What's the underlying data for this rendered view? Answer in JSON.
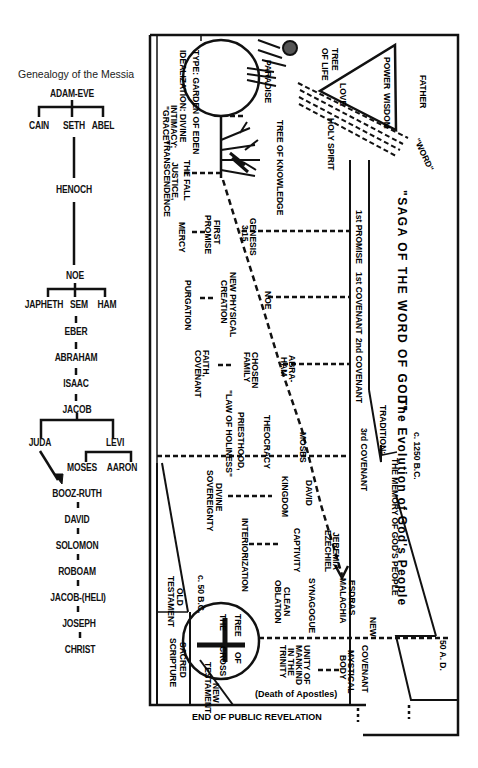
{
  "genealogy": {
    "title": "Genealogy of the Messia",
    "nodes": {
      "adam_eve": "ADAM-EVE",
      "cain": "CAIN",
      "seth": "SETH",
      "abel": "ABEL",
      "henoch": "HENOCH",
      "noe": "NOE",
      "japheth": "JAPHETH",
      "sem": "SEM",
      "ham": "HAM",
      "eber": "EBER",
      "abraham": "ABRAHAM",
      "isaac": "ISAAC",
      "jacob": "JACOB",
      "juda": "JUDA",
      "levi": "LEVI",
      "moses": "MOSES",
      "aaron": "AARON",
      "booz_ruth": "BOOZ-RUTH",
      "david": "DAVID",
      "solomon": "SOLOMON",
      "roboam": "ROBOAM",
      "jacob_heli": "JACOB-(HELI)",
      "joseph": "JOSEPH",
      "christ": "CHRIST"
    }
  },
  "saga": {
    "title": "\"SAGA OF THE WORD OF GOD\"",
    "subtitle": "The Evolution of God's People",
    "date_start": "c. 1250 B.C.",
    "date_end": "50 A. D.",
    "date_mid": "c. 50 B.C.",
    "tradition_label": "TRADITION:",
    "tradition_text": "THE MEMORY OF GOD'S PEOPLE",
    "footer": "END OF PUBLIC REVELATION",
    "trinity": {
      "father": "FATHER",
      "power": "POWER",
      "wisdom": "WISDOM",
      "love": "LOVE",
      "holy_spirit": "HOLY SPIRIT",
      "word": "\"WORD\""
    },
    "eden": {
      "tree_of_life_1": "TREE",
      "tree_of_life_2": "OF LIFE",
      "paradise": "PARADISE",
      "tree_of_knowledge": "TREE OF KNOWLEDGE",
      "type": "TYPE: GARDEN OF EDEN",
      "idealization": "IDEALIZATION: DIVINE",
      "intimacy": "INTIMACY;",
      "grace": "\"GRACE\"",
      "the_fall": "THE FALL",
      "justice": "JUSTICE,",
      "transcendence": "TRANSCENDENCE"
    },
    "covenants": {
      "promise1": "1st PROMISE",
      "cov1": "1st COVENANT",
      "cov2": "2nd COVENANT",
      "cov3": "3rd COVENANT",
      "new_1": "NEW",
      "new_2": "COVENANT"
    },
    "events": {
      "genesis_1": "GENESIS",
      "genesis_2": "3,15",
      "first_promise_1": "FIRST",
      "first_promise_2": "PROMISE",
      "mercy": "MERCY",
      "noe": "NOE",
      "new_physical_1": "NEW PHYSICAL",
      "new_physical_2": "CREATION",
      "purgation": "PURGATION",
      "abraham_1": "ABRA-",
      "abraham_2": "HAM",
      "chosen_1": "CHOSEN",
      "chosen_2": "FAMILY",
      "faith_1": "FAITH,",
      "faith_2": "COVENANT",
      "moses": "MOSES",
      "theocracy": "THEOCRACY",
      "priesthood": "PRIESTHOOD,",
      "law_of_holiness": "\"LAW OF HOLINESS\"",
      "david": "DAVID",
      "kingdom": "KINGDOM",
      "divine_1": "DIVINE",
      "divine_2": "SOVEREIGNTY",
      "jeremia": "JEREMIA",
      "ezechiel": "EZECHIEL",
      "captivity": "CAPTIVITY",
      "interiorization": "INTERIORIZATION",
      "esdras": "ESDRAS",
      "malachia": "MALACHIA",
      "synagogue": "SYNAGOGUE",
      "clean_1": "CLEAN",
      "clean_2": "OBLATION",
      "mystical_1": "MYSTICAL",
      "mystical_2": "BODY",
      "unity_1": "UNITY OF",
      "unity_2": "MANKIND",
      "unity_3": "IN THE",
      "unity_4": "TRINITY",
      "death_apostles": "(Death of Apostles)",
      "tree_cross_1": "TREE",
      "tree_cross_2": "OF",
      "tree_cross_3": "THE",
      "tree_cross_4": "CROSS",
      "old_1": "OLD",
      "old_2": "TESTAMENT",
      "sacred_1": "SACRED",
      "sacred_2": "SCRIPTURE",
      "new_t_1": "NEW",
      "new_t_2": "TESTAMENT"
    }
  }
}
